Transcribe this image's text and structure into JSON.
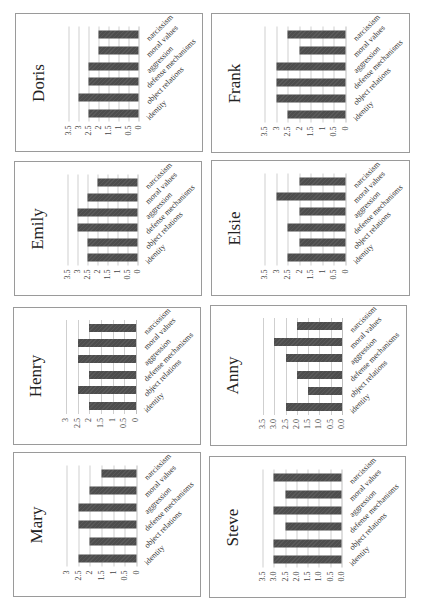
{
  "layout": {
    "grid_columns": 2,
    "grid_rows": 4,
    "rotation_note": "each chart rendered rotated 90deg counter-clockwise"
  },
  "colors": {
    "bar": "#4d4d4d",
    "gridline": "#cfcfcf",
    "panel_border": "#9a9a9a"
  },
  "chart_data": [
    {
      "type": "bar",
      "title": "Doris",
      "categories": [
        "identity",
        "object relations",
        "defense mechanisms",
        "aggression",
        "moral values",
        "narcissism"
      ],
      "values": [
        2.5,
        3,
        2.5,
        2.5,
        2,
        2
      ],
      "ylim": [
        0,
        3.5
      ],
      "yticks": [
        "0",
        "0.5",
        "1",
        "1.5",
        "2",
        "2.5",
        "3",
        "3.5"
      ],
      "grid": true,
      "xlabel": "",
      "ylabel": ""
    },
    {
      "type": "bar",
      "title": "Frank",
      "categories": [
        "identity",
        "object relations",
        "defense mechanisms",
        "aggression",
        "moral values",
        "narcissism"
      ],
      "values": [
        2.5,
        3,
        3,
        3,
        2,
        2.5
      ],
      "ylim": [
        0,
        3.5
      ],
      "yticks": [
        "0",
        "0.5",
        "1",
        "1.5",
        "2",
        "2.5",
        "3",
        "3.5"
      ],
      "grid": true,
      "xlabel": "",
      "ylabel": ""
    },
    {
      "type": "bar",
      "title": "Emily",
      "categories": [
        "identity",
        "object relations",
        "defense mechanisms",
        "aggression",
        "moral values",
        "narcissism"
      ],
      "values": [
        2.5,
        2.5,
        3,
        3,
        2.5,
        2
      ],
      "ylim": [
        0,
        3.5
      ],
      "yticks": [
        "0",
        "0.5",
        "1",
        "1.5",
        "2",
        "2.5",
        "3",
        "3.5"
      ],
      "grid": true,
      "xlabel": "",
      "ylabel": ""
    },
    {
      "type": "bar",
      "title": "Elsie",
      "categories": [
        "identity",
        "object relations",
        "defense mechanisms",
        "aggression",
        "moral values",
        "narcissism"
      ],
      "values": [
        2.5,
        2,
        2.5,
        2,
        3,
        2
      ],
      "ylim": [
        0,
        3.5
      ],
      "yticks": [
        "0",
        "0.5",
        "1",
        "1.5",
        "2",
        "2.5",
        "3",
        "3.5"
      ],
      "grid": true,
      "xlabel": "",
      "ylabel": ""
    },
    {
      "type": "bar",
      "title": "Henry",
      "categories": [
        "identity",
        "object relations",
        "defense mechanisms",
        "aggression",
        "moral values",
        "narcissism"
      ],
      "values": [
        2,
        2.5,
        2,
        2.5,
        2.5,
        2
      ],
      "ylim": [
        0,
        3
      ],
      "yticks": [
        "0",
        "0.5",
        "1",
        "1.5",
        "2",
        "2.5",
        "3"
      ],
      "grid": true,
      "xlabel": "",
      "ylabel": ""
    },
    {
      "type": "bar",
      "title": "Anny",
      "categories": [
        "identity",
        "object relations",
        "defense mechanisms",
        "aggression",
        "moral values",
        "narcissism"
      ],
      "values": [
        2.5,
        1.5,
        2.0,
        2.5,
        3.0,
        2.0
      ],
      "ylim": [
        0,
        3.5
      ],
      "yticks": [
        "0.0",
        "0.5",
        "1.0",
        "1.5",
        "2.0",
        "2.5",
        "3.0",
        "3.5"
      ],
      "grid": true,
      "xlabel": "",
      "ylabel": ""
    },
    {
      "type": "bar",
      "title": "Mary",
      "categories": [
        "identity",
        "object relations",
        "defense mechanisms",
        "aggression",
        "moral values",
        "narcissism"
      ],
      "values": [
        2.5,
        2,
        2.5,
        2.5,
        2,
        1.5
      ],
      "ylim": [
        0,
        3
      ],
      "yticks": [
        "0",
        "0.5",
        "1",
        "1.5",
        "2",
        "2.5",
        "3"
      ],
      "grid": true,
      "xlabel": "",
      "ylabel": ""
    },
    {
      "type": "bar",
      "title": "Steve",
      "categories": [
        "identity",
        "object relations",
        "defense mechanisms",
        "aggression",
        "moral values",
        "narcissism"
      ],
      "values": [
        3.0,
        3.0,
        2.5,
        3.0,
        2.5,
        3.0
      ],
      "ylim": [
        0,
        3.5
      ],
      "yticks": [
        "0.0",
        "0.5",
        "1.0",
        "1.5",
        "2.0",
        "2.5",
        "3.0",
        "3.5"
      ],
      "grid": true,
      "xlabel": "",
      "ylabel": ""
    }
  ],
  "panels": [
    {
      "chart": 0,
      "x": 15,
      "y": 13,
      "w": 188,
      "h": 139
    },
    {
      "chart": 1,
      "x": 211,
      "y": 13,
      "w": 199,
      "h": 140
    },
    {
      "chart": 2,
      "x": 14,
      "y": 161,
      "w": 188,
      "h": 135
    },
    {
      "chart": 3,
      "x": 211,
      "y": 160,
      "w": 199,
      "h": 136
    },
    {
      "chart": 4,
      "x": 13,
      "y": 307,
      "w": 188,
      "h": 138
    },
    {
      "chart": 5,
      "x": 210,
      "y": 305,
      "w": 197,
      "h": 141
    },
    {
      "chart": 6,
      "x": 13,
      "y": 452,
      "w": 188,
      "h": 145
    },
    {
      "chart": 7,
      "x": 209,
      "y": 456,
      "w": 197,
      "h": 142
    }
  ]
}
